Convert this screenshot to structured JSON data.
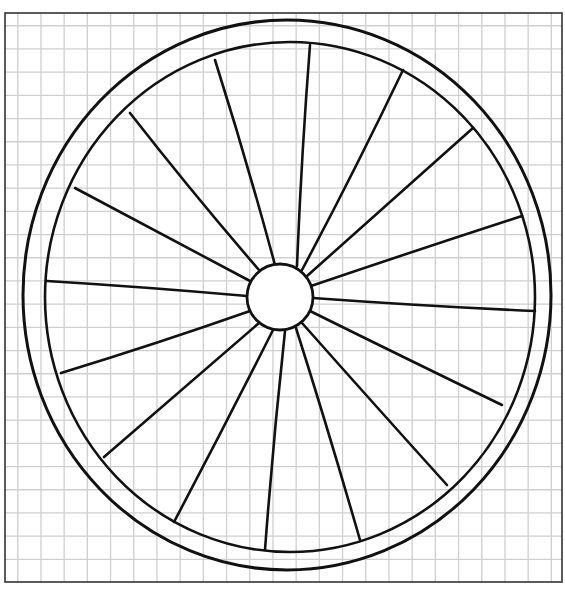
{
  "drawing": {
    "subject": "wagon wheel",
    "background": "#ffffff",
    "stroke_color": "#111111",
    "grid_color": "#cfcfcf",
    "frame_color": "#333333",
    "frame": {
      "x": 5,
      "y": 13,
      "width": 557,
      "height": 569
    },
    "grid_spacing": 23.2,
    "outer_rim": {
      "cx": 287,
      "cy": 295,
      "rx": 264,
      "ry": 275
    },
    "inner_rim": {
      "cx": 290,
      "cy": 297,
      "rx": 245,
      "ry": 255
    },
    "hub": {
      "cx": 280,
      "cy": 297,
      "r": 33
    },
    "spoke_count": 16,
    "spokes": [
      {
        "rim": [
          310,
          45
        ],
        "hub": [
          297,
          266
        ]
      },
      {
        "rim": [
          403,
          70
        ],
        "hub": [
          302,
          270
        ]
      },
      {
        "rim": [
          473,
          128
        ],
        "hub": [
          307,
          276
        ]
      },
      {
        "rim": [
          522,
          216
        ],
        "hub": [
          311,
          286
        ]
      },
      {
        "rim": [
          535,
          311
        ],
        "hub": [
          313,
          298
        ]
      },
      {
        "rim": [
          502,
          405
        ],
        "hub": [
          310,
          311
        ]
      },
      {
        "rim": [
          447,
          485
        ],
        "hub": [
          302,
          323
        ]
      },
      {
        "rim": [
          360,
          540
        ],
        "hub": [
          296,
          328
        ]
      },
      {
        "rim": [
          265,
          550
        ],
        "hub": [
          285,
          331
        ]
      },
      {
        "rim": [
          174,
          522
        ],
        "hub": [
          273,
          330
        ]
      },
      {
        "rim": [
          104,
          457
        ],
        "hub": [
          259,
          323
        ]
      },
      {
        "rim": [
          61,
          373
        ],
        "hub": [
          250,
          311
        ]
      },
      {
        "rim": [
          47,
          281
        ],
        "hub": [
          247,
          296
        ]
      },
      {
        "rim": [
          75,
          188
        ],
        "hub": [
          250,
          281
        ]
      },
      {
        "rim": [
          130,
          113
        ],
        "hub": [
          259,
          270
        ]
      },
      {
        "rim": [
          215,
          60
        ],
        "hub": [
          275,
          265
        ]
      }
    ]
  }
}
